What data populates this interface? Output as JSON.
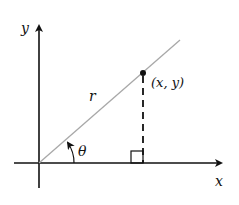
{
  "diagram": {
    "type": "polar-coordinates",
    "labels": {
      "x_axis": "x",
      "y_axis": "y",
      "radius": "r",
      "angle": "θ",
      "point": "(x, y)"
    },
    "colors": {
      "axes": "#111111",
      "ray": "#a8a8a8",
      "point": "#111111",
      "background": "#ffffff"
    },
    "geometry": {
      "origin": [
        39,
        163
      ],
      "point": [
        143,
        73
      ],
      "ray_end": [
        180,
        40
      ],
      "x_axis_range": [
        14,
        227
      ],
      "y_axis_range": [
        188,
        20
      ]
    }
  }
}
